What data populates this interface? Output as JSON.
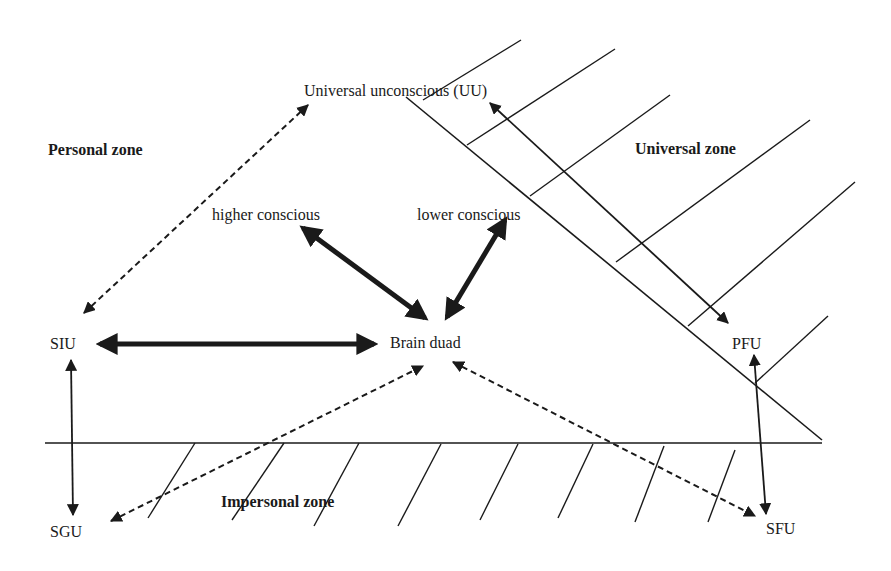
{
  "labels": {
    "uu": "Universal unconscious (UU)",
    "personal_zone": "Personal zone",
    "universal_zone": "Universal zone",
    "higher_conscious": "higher conscious",
    "lower_conscious": "lower conscious",
    "siu": "SIU",
    "brain_duad": "Brain duad",
    "pfu": "PFU",
    "sgu": "SGU",
    "impersonal_zone": "Impersonal zone",
    "sfu": "SFU"
  },
  "colors": {
    "ink": "#1a1a1a",
    "background": "#ffffff"
  },
  "connections": [
    {
      "from": "SIU",
      "to": "UU",
      "style": "dashed",
      "direction": "bidirectional"
    },
    {
      "from": "higher conscious",
      "to": "Brain duad",
      "style": "thick",
      "direction": "bidirectional"
    },
    {
      "from": "lower conscious",
      "to": "Brain duad",
      "style": "thick",
      "direction": "bidirectional"
    },
    {
      "from": "SIU",
      "to": "Brain duad",
      "style": "thick",
      "direction": "bidirectional"
    },
    {
      "from": "SIU",
      "to": "SGU",
      "style": "thin",
      "direction": "bidirectional"
    },
    {
      "from": "SGU",
      "to": "Brain duad",
      "style": "dashed",
      "direction": "bidirectional"
    },
    {
      "from": "Brain duad",
      "to": "SFU",
      "style": "dashed",
      "direction": "bidirectional"
    },
    {
      "from": "UU",
      "to": "PFU",
      "style": "thin",
      "direction": "bidirectional"
    },
    {
      "from": "PFU",
      "to": "SFU",
      "style": "thin",
      "direction": "bidirectional"
    }
  ]
}
